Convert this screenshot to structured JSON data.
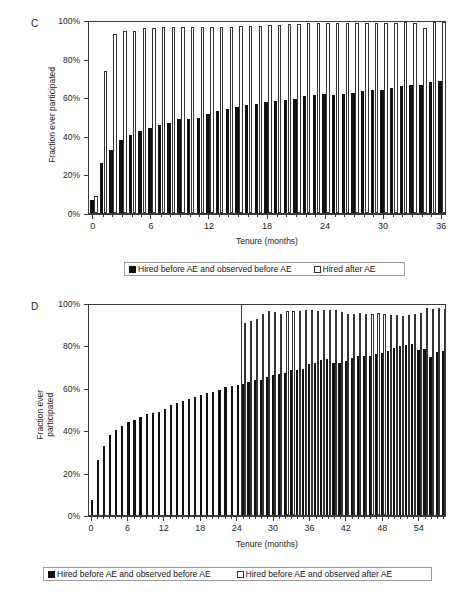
{
  "figure": {
    "panels": [
      {
        "letter": "C",
        "ylabel": "Fraction ever participated",
        "ylabel_lines": [
          "Fraction ever participated"
        ],
        "xlabel": "Tenure (months)",
        "ytick_labels": [
          "0%",
          "20%",
          "40%",
          "60%",
          "80%",
          "100%"
        ],
        "xtick_labels": [
          "0",
          "6",
          "12",
          "18",
          "24",
          "30",
          "36"
        ],
        "legend": [
          {
            "marker": "filled-square",
            "label": "Hired before AE and observed before AE"
          },
          {
            "marker": "hollow-square",
            "label": "Hired after AE"
          }
        ]
      },
      {
        "letter": "D",
        "ylabel": "Fraction ever participated",
        "ylabel_lines": [
          "Fraction ever",
          "participated"
        ],
        "xlabel": "Tenure (months)",
        "ytick_labels": [
          "0%",
          "20%",
          "40%",
          "60%",
          "80%",
          "100%"
        ],
        "xtick_labels": [
          "0",
          "6",
          "12",
          "18",
          "24",
          "30",
          "36",
          "42",
          "48",
          "54"
        ],
        "legend": [
          {
            "marker": "filled-square",
            "label": "Hired before AE and observed before AE"
          },
          {
            "marker": "hollow-square",
            "label": "Hired before AE and observed after AE"
          }
        ]
      }
    ]
  },
  "chart_data": [
    {
      "type": "bar",
      "panel": "C",
      "title": "",
      "xlabel": "Tenure (months)",
      "ylabel": "Fraction ever participated",
      "xlim": [
        0,
        36
      ],
      "ylim": [
        0,
        100
      ],
      "yticks": [
        0,
        20,
        40,
        60,
        80,
        100
      ],
      "ytick_labels": [
        "0%",
        "20%",
        "40%",
        "60%",
        "80%",
        "100%"
      ],
      "xticks": [
        0,
        6,
        12,
        18,
        24,
        30,
        36
      ],
      "grid": false,
      "legend_position": "below",
      "x": [
        0,
        1,
        2,
        3,
        4,
        5,
        6,
        7,
        8,
        9,
        10,
        11,
        12,
        13,
        14,
        15,
        16,
        17,
        18,
        19,
        20,
        21,
        22,
        23,
        24,
        25,
        26,
        27,
        28,
        29,
        30,
        31,
        32,
        33,
        34,
        35,
        36
      ],
      "series": [
        {
          "name": "Hired before AE and observed before AE",
          "color": "#111111",
          "values": [
            7.0,
            26.0,
            32.8,
            37.8,
            40.5,
            42.7,
            44.3,
            45.5,
            46.8,
            48.6,
            48.9,
            49.4,
            51.3,
            52.8,
            53.9,
            54.8,
            55.9,
            56.6,
            57.4,
            58.0,
            58.6,
            59.3,
            60.7,
            61.2,
            61.5,
            61.2,
            61.7,
            62.4,
            63.2,
            63.5,
            63.6,
            64.7,
            65.8,
            66.2,
            66.4,
            67.9,
            68.5
          ]
        },
        {
          "name": "Hired after AE",
          "color": "#ffffff",
          "values": [
            8.8,
            73.6,
            92.8,
            94.5,
            94.5,
            96.0,
            95.9,
            96.2,
            96.6,
            96.6,
            96.4,
            96.6,
            96.4,
            96.5,
            96.6,
            96.7,
            97.0,
            97.0,
            97.3,
            97.5,
            97.8,
            97.8,
            98.6,
            98.7,
            98.6,
            98.5,
            98.4,
            98.4,
            98.4,
            98.3,
            98.3,
            98.6,
            98.8,
            98.3,
            96.1,
            98.9,
            99.0
          ]
        }
      ]
    },
    {
      "type": "bar",
      "panel": "D",
      "title": "",
      "xlabel": "Tenure (months)",
      "ylabel": "Fraction ever participated",
      "xlim": [
        0,
        58
      ],
      "ylim": [
        0,
        100
      ],
      "yticks": [
        0,
        20,
        40,
        60,
        80,
        100
      ],
      "ytick_labels": [
        "0%",
        "20%",
        "40%",
        "60%",
        "80%",
        "100%"
      ],
      "xticks": [
        0,
        6,
        12,
        18,
        24,
        30,
        36,
        42,
        48,
        54
      ],
      "grid": false,
      "legend_position": "below",
      "divider_at_x": 24,
      "x": [
        0,
        1,
        2,
        3,
        4,
        5,
        6,
        7,
        8,
        9,
        10,
        11,
        12,
        13,
        14,
        15,
        16,
        17,
        18,
        19,
        20,
        21,
        22,
        23,
        24,
        25,
        26,
        27,
        28,
        29,
        30,
        31,
        32,
        33,
        34,
        35,
        36,
        37,
        38,
        39,
        40,
        41,
        42,
        43,
        44,
        45,
        46,
        47,
        48,
        49,
        50,
        51,
        52,
        53,
        54,
        55,
        56,
        57,
        58
      ],
      "series": [
        {
          "name": "Hired before AE and observed before AE",
          "color": "#111111",
          "values": [
            7.0,
            25.9,
            32.6,
            37.6,
            40.0,
            42.1,
            43.8,
            44.9,
            46.3,
            47.7,
            48.2,
            48.6,
            50.0,
            51.7,
            52.8,
            53.7,
            54.8,
            55.7,
            56.5,
            57.4,
            58.1,
            59.0,
            60.2,
            60.9,
            61.3,
            62.0,
            62.6,
            63.8,
            63.5,
            65.2,
            66.0,
            66.4,
            67.0,
            68.2,
            68.5,
            69.0,
            71.3,
            71.9,
            73.0,
            73.4,
            71.6,
            71.8,
            72.7,
            74.2,
            74.9,
            74.8,
            74.9,
            75.8,
            76.5,
            77.4,
            78.8,
            79.7,
            80.3,
            80.5,
            77.9,
            78.2,
            74.3,
            77.0,
            77.5
          ]
        },
        {
          "name": "Hired before AE and observed after AE",
          "color": "#ffffff",
          "values": [
            null,
            null,
            null,
            null,
            null,
            null,
            null,
            null,
            null,
            null,
            null,
            null,
            null,
            null,
            null,
            null,
            null,
            null,
            null,
            null,
            null,
            null,
            null,
            null,
            null,
            90.7,
            91.3,
            92.6,
            94.8,
            96.4,
            95.8,
            94.8,
            96.0,
            96.0,
            96.2,
            96.6,
            96.9,
            96.2,
            96.7,
            96.8,
            96.6,
            95.8,
            95.0,
            94.8,
            95.2,
            94.7,
            95.0,
            95.1,
            94.7,
            94.5,
            94.5,
            94.0,
            94.3,
            94.7,
            95.2,
            97.5,
            97.3,
            97.5,
            97.4
          ]
        }
      ]
    }
  ]
}
